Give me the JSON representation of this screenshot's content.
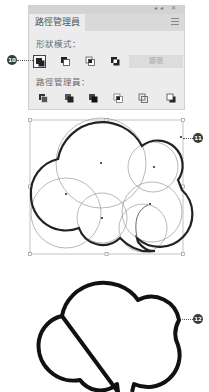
{
  "panel": {
    "topbar_icons": "◂◂ ✕",
    "tab_title": "路徑管理員",
    "menu_icon": "hamburger-menu-icon",
    "shape_modes": {
      "label": "形狀模式：",
      "buttons": [
        {
          "name": "unite",
          "icon": "unite-icon",
          "selected": true
        },
        {
          "name": "minus-front",
          "icon": "minus-front-icon",
          "selected": false
        },
        {
          "name": "intersect",
          "icon": "intersect-icon",
          "selected": false
        },
        {
          "name": "exclude",
          "icon": "exclude-icon",
          "selected": false
        }
      ],
      "expand_label": "擴張",
      "expand_enabled": false
    },
    "pathfinders": {
      "label": "路徑管理員：",
      "buttons": [
        {
          "name": "divide",
          "icon": "divide-icon"
        },
        {
          "name": "trim",
          "icon": "trim-icon"
        },
        {
          "name": "merge",
          "icon": "merge-icon"
        },
        {
          "name": "crop",
          "icon": "crop-icon"
        },
        {
          "name": "outline",
          "icon": "outline-icon"
        },
        {
          "name": "minus-back",
          "icon": "minus-back-icon"
        }
      ]
    }
  },
  "callouts": [
    {
      "number": "10",
      "target": "unite-button"
    },
    {
      "number": "11",
      "target": "selected-circles-group"
    },
    {
      "number": "12",
      "target": "merged-cloud-shape"
    }
  ],
  "colors": {
    "panel_bg": "#ececec",
    "panel_header": "#d3d3d3",
    "stroke_dark": "#222222",
    "circle_guides": "#999999",
    "callout_bg": "#3a3a3a"
  }
}
